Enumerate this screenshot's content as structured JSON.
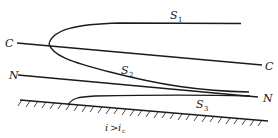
{
  "diagram": {
    "type": "water-surface-profiles-steep-slope",
    "lines": {
      "critical_depth_line": {
        "label_left": "C",
        "label_right": "C"
      },
      "normal_depth_line": {
        "label_left": "N",
        "label_right": "N"
      }
    },
    "curves": [
      {
        "id": "S1",
        "label": "S",
        "subscript": "1"
      },
      {
        "id": "S2",
        "label": "S",
        "subscript": "2"
      },
      {
        "id": "S3",
        "label": "S",
        "subscript": "3"
      }
    ],
    "bed": {
      "condition_main": "i",
      "condition_op": ">",
      "condition_rhs": "i",
      "condition_rhs_sub": "c"
    }
  }
}
